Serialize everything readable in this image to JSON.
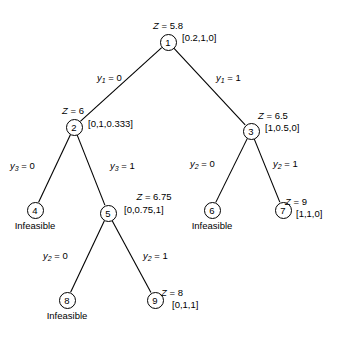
{
  "diagram": {
    "nodes": [
      {
        "id": "1",
        "label": "1",
        "x": 168,
        "y": 42,
        "z": "Z = 5.8",
        "z_x": 168,
        "z_y": 20,
        "solution": "[0.2,1,0]",
        "sol_x": 182,
        "sol_y": 32,
        "status": ""
      },
      {
        "id": "2",
        "label": "2",
        "x": 74,
        "y": 127,
        "z": "Z = 6",
        "z_x": 62,
        "z_y": 105,
        "solution": "[0,1,0.333]",
        "sol_x": 88,
        "sol_y": 118,
        "status": ""
      },
      {
        "id": "3",
        "label": "3",
        "x": 251,
        "y": 131,
        "z": "Z = 6.5",
        "z_x": 258,
        "z_y": 110,
        "solution": "[1,0.5,0]",
        "sol_x": 265,
        "sol_y": 122,
        "status": ""
      },
      {
        "id": "4",
        "label": "4",
        "x": 35,
        "y": 210,
        "z": "",
        "z_x": 0,
        "z_y": 0,
        "solution": "",
        "sol_x": 0,
        "sol_y": 0,
        "status": "Infeasible",
        "st_x": 35,
        "st_y": 220
      },
      {
        "id": "5",
        "label": "5",
        "x": 108,
        "y": 213,
        "z": "Z = 6.75",
        "z_x": 154,
        "z_y": 191,
        "solution": "[0,0.75,1]",
        "sol_x": 124,
        "sol_y": 204,
        "status": ""
      },
      {
        "id": "6",
        "label": "6",
        "x": 212,
        "y": 210,
        "z": "",
        "z_x": 0,
        "z_y": 0,
        "solution": "",
        "sol_x": 0,
        "sol_y": 0,
        "status": "Infeasible",
        "st_x": 212,
        "st_y": 220
      },
      {
        "id": "7",
        "label": "7",
        "x": 283,
        "y": 210,
        "z": "Z = 9",
        "z_x": 296,
        "z_y": 196,
        "solution": "[1,1,0]",
        "sol_x": 296,
        "sol_y": 208,
        "status": ""
      },
      {
        "id": "8",
        "label": "8",
        "x": 67,
        "y": 300,
        "z": "",
        "z_x": 0,
        "z_y": 0,
        "solution": "",
        "sol_x": 0,
        "sol_y": 0,
        "status": "Infeasible",
        "st_x": 67,
        "st_y": 310
      },
      {
        "id": "9",
        "label": "9",
        "x": 155,
        "y": 300,
        "z": "Z = 8",
        "z_x": 172,
        "z_y": 287,
        "solution": "[0,1,1]",
        "sol_x": 172,
        "sol_y": 299,
        "status": ""
      }
    ],
    "edges": [
      {
        "from": "1",
        "to": "2",
        "var": "y",
        "sub": "1",
        "value": "= 0",
        "lx": 97,
        "ly": 72
      },
      {
        "from": "1",
        "to": "3",
        "var": "y",
        "sub": "1",
        "value": "= 1",
        "lx": 216,
        "ly": 72
      },
      {
        "from": "2",
        "to": "4",
        "var": "y",
        "sub": "3",
        "value": "= 0",
        "lx": 10,
        "ly": 160
      },
      {
        "from": "2",
        "to": "5",
        "var": "y",
        "sub": "3",
        "value": "= 1",
        "lx": 110,
        "ly": 160
      },
      {
        "from": "3",
        "to": "6",
        "var": "y",
        "sub": "2",
        "value": "= 0",
        "lx": 190,
        "ly": 158
      },
      {
        "from": "3",
        "to": "7",
        "var": "y",
        "sub": "2",
        "value": "= 1",
        "lx": 273,
        "ly": 158
      },
      {
        "from": "5",
        "to": "8",
        "var": "y",
        "sub": "2",
        "value": "= 0",
        "lx": 43,
        "ly": 250
      },
      {
        "from": "5",
        "to": "9",
        "var": "y",
        "sub": "2",
        "value": "= 1",
        "lx": 143,
        "ly": 250
      }
    ],
    "colors": {
      "stroke": "#000000",
      "background": "#ffffff"
    }
  }
}
